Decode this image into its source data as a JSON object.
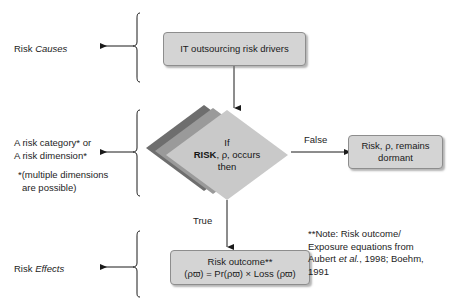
{
  "figure": {
    "colors": {
      "box_fill": "#d4d4d4",
      "box_border": "#8d8d8d",
      "diamond_front": "#c9c9c9",
      "diamond_mid": "#9a9a9a",
      "diamond_back": "#6e6e6e",
      "line": "#1a1a1a",
      "text": "#1a1a1a",
      "background": "#ffffff"
    }
  },
  "stage_labels": {
    "causes": {
      "plain": "Risk ",
      "italic": "Causes"
    },
    "category": {
      "line1": "A risk category* or",
      "line2": "A risk dimension*",
      "footnote1": "*(multiple dimensions",
      "footnote2": "are possible)"
    },
    "effects": {
      "plain": "Risk ",
      "italic": "Effects"
    }
  },
  "nodes": {
    "drivers": {
      "text": "IT outsourcing risk drivers"
    },
    "decision": {
      "line1": "If",
      "bold": "RISK",
      "line2_rest": ", ρ, occurs",
      "line3": "then"
    },
    "dormant": {
      "line1": "Risk, ρ, remains",
      "line2": "dormant"
    },
    "outcome": {
      "line1": "Risk outcome**",
      "line2": "(ρϖ) = Pr(ρϖ) × Loss (ρϖ)"
    }
  },
  "edges": {
    "false_label": "False",
    "true_label": "True"
  },
  "note": {
    "line1": "**Note: Risk outcome/",
    "line2": "Exposure equations from",
    "line3_pre": "Aubert ",
    "line3_italic": "et al.",
    "line3_post": ", 1998; Boehm,",
    "line4": "1991"
  }
}
